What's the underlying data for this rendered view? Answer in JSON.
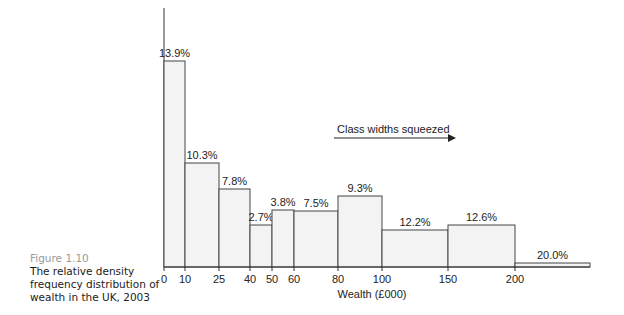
{
  "caption": {
    "figure_number": "Figure 1.10",
    "text": "The relative density frequency distribution of wealth in the UK, 2003"
  },
  "annotation": {
    "text": "Class widths squeezed"
  },
  "chart_data": {
    "type": "bar",
    "subtype": "histogram",
    "title": "",
    "xlabel": "Wealth (£000)",
    "ylabel": "",
    "x_ticks": [
      "0",
      "10",
      "25",
      "40",
      "50",
      "60",
      "80",
      "100",
      "150",
      "200"
    ],
    "bins": [
      {
        "from": 0,
        "to": 10,
        "label": "13.9%",
        "value": 13.9
      },
      {
        "from": 10,
        "to": 25,
        "label": "10.3%",
        "value": 10.3
      },
      {
        "from": 25,
        "to": 40,
        "label": "7.8%",
        "value": 7.8
      },
      {
        "from": 40,
        "to": 50,
        "label": "2.7%",
        "value": 2.7
      },
      {
        "from": 50,
        "to": 60,
        "label": "3.8%",
        "value": 3.8
      },
      {
        "from": 60,
        "to": 80,
        "label": "7.5%",
        "value": 7.5
      },
      {
        "from": 80,
        "to": 100,
        "label": "9.3%",
        "value": 9.3
      },
      {
        "from": 100,
        "to": 150,
        "label": "12.2%",
        "value": 12.2
      },
      {
        "from": 150,
        "to": 200,
        "label": "12.6%",
        "value": 12.6
      },
      {
        "from": 200,
        "to": null,
        "label": "20.0%",
        "value": 20.0
      }
    ],
    "annotations": [
      "Class widths squeezed"
    ],
    "grid": false,
    "legend": null
  }
}
